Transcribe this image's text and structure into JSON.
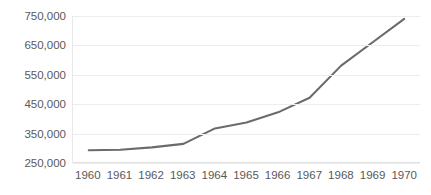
{
  "chart_data": {
    "type": "line",
    "title": "",
    "subtitle": "",
    "xlabel": "",
    "ylabel": "",
    "categories": [
      "1960",
      "1961",
      "1962",
      "1963",
      "1964",
      "1965",
      "1966",
      "1967",
      "1968",
      "1969",
      "1970"
    ],
    "values": [
      290000,
      292000,
      300000,
      312000,
      365000,
      385000,
      420000,
      470000,
      580000,
      660000,
      740000
    ],
    "series": [
      {
        "name": "Series 1",
        "values": [
          290000,
          292000,
          300000,
          312000,
          365000,
          385000,
          420000,
          470000,
          580000,
          660000,
          740000
        ],
        "color": "#6b6b6b"
      }
    ],
    "ylim": [
      250000,
      750000
    ],
    "y_ticks": [
      250000,
      350000,
      450000,
      550000,
      650000,
      750000
    ],
    "y_tick_labels": [
      "250,000",
      "350,000",
      "450,000",
      "550,000",
      "650,000",
      "750,000"
    ],
    "x_tick_labels": [
      "1960",
      "1961",
      "1962",
      "1963",
      "1964",
      "1965",
      "1966",
      "1967",
      "1968",
      "1969",
      "1970"
    ],
    "grid": true,
    "grid_axis": "y",
    "legend": false,
    "legend_position": "none",
    "annotations": []
  },
  "style": {
    "line_color": "#6b6b6b",
    "grid_color": "#ededed",
    "axis_color": "#e0e0e0",
    "tick_label_color": "#595959",
    "background": "#ffffff"
  }
}
